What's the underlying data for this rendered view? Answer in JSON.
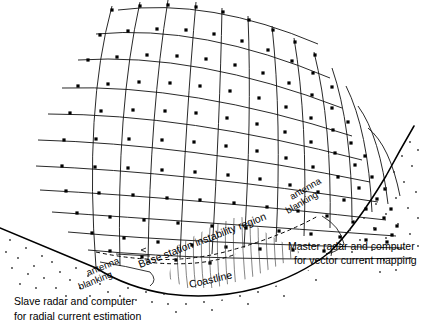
{
  "figure": {
    "background_color": "#ffffff",
    "ink_color": "#000000",
    "width": 421,
    "height": 332
  },
  "labels": {
    "slave_line1": "Slave radar and computer",
    "slave_line2": "for radial current estimation",
    "master_line1": "Master radar and computer",
    "master_line2": "for vector current mapping",
    "instability": "Base station instability region",
    "coastline": "Coastline",
    "antenna_left_line1": "antenna",
    "antenna_left_line2": "blanking",
    "antenna_right_line1": "antenna",
    "antenna_right_line2": "blanking"
  },
  "regions": {
    "land_fill": "stipple",
    "water_fill": "white",
    "instability_fill": "vertical-hatch"
  },
  "mesh": {
    "type": "curvilinear-polar",
    "arcs": 11,
    "radials": 13,
    "node_shape": "square",
    "node_size_px": 3.2
  }
}
